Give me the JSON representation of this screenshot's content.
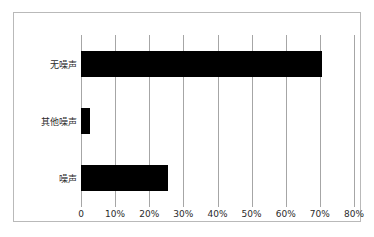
{
  "chart_data": {
    "type": "bar",
    "orientation": "horizontal",
    "title": "",
    "subtitle": "",
    "xlabel": "",
    "ylabel": "",
    "categories": [
      "无噪声",
      "其他噪声",
      "噪声"
    ],
    "values": [
      70.5,
      2.5,
      25.5
    ],
    "series": [
      {
        "name": "",
        "values": [
          70.5,
          2.5,
          25.5
        ]
      }
    ],
    "xlim": [
      0,
      80
    ],
    "ylim": null,
    "xticks": [
      0,
      10,
      20,
      30,
      40,
      50,
      60,
      70,
      80
    ],
    "xtick_labels": [
      "0",
      "10%",
      "20%",
      "30%",
      "40%",
      "50%",
      "60%",
      "70%",
      "80%"
    ],
    "grid": true,
    "grid_axis": "x",
    "legend": false,
    "legend_position": "none",
    "annotations": [],
    "bar_color": "#000000",
    "gridline_color": "#a6a6a6",
    "frame_color": "#b9b9b9",
    "background_color": "#ffffff"
  }
}
